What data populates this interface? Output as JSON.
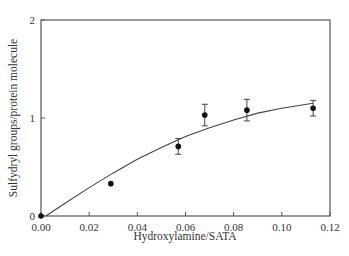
{
  "chart_data": {
    "type": "scatter",
    "title": "",
    "xlabel": "Hydroxylamine/SATA",
    "ylabel": "Sulfydryl groups/protein molecule",
    "xlim": [
      0,
      0.12
    ],
    "ylim": [
      0,
      2
    ],
    "x_ticks": [
      "0.00",
      "0.02",
      "0.04",
      "0.06",
      "0.08",
      "0.10",
      "0.12"
    ],
    "y_ticks": [
      "0",
      "1",
      "2"
    ],
    "grid": false,
    "legend": null,
    "series": [
      {
        "name": "measured",
        "points": [
          {
            "x": 0.0,
            "y": 0.0,
            "err": 0
          },
          {
            "x": 0.029,
            "y": 0.33,
            "err": 0
          },
          {
            "x": 0.057,
            "y": 0.71,
            "err": 0.08
          },
          {
            "x": 0.068,
            "y": 1.03,
            "err": 0.11
          },
          {
            "x": 0.0855,
            "y": 1.08,
            "err": 0.11
          },
          {
            "x": 0.113,
            "y": 1.1,
            "err": 0.08
          }
        ]
      },
      {
        "name": "fit",
        "type": "line",
        "x": [
          0.002,
          0.01,
          0.02,
          0.03,
          0.04,
          0.05,
          0.06,
          0.07,
          0.08,
          0.09,
          0.1,
          0.113
        ],
        "values": [
          0.0,
          0.13,
          0.29,
          0.44,
          0.58,
          0.7,
          0.81,
          0.9,
          0.98,
          1.05,
          1.1,
          1.15
        ]
      }
    ]
  }
}
